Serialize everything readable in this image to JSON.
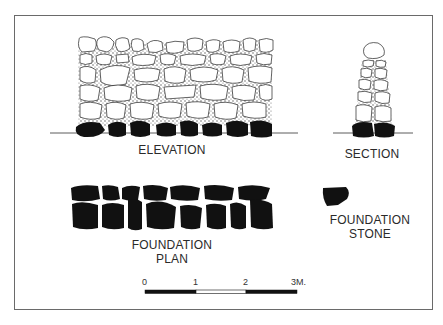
{
  "drawing": {
    "subject": "dry stone wall",
    "views": {
      "elevation": {
        "label": "ELEVATION"
      },
      "section": {
        "label": "SECTION"
      },
      "foundation_plan": {
        "label_line1": "FOUNDATION",
        "label_line2": "PLAN"
      }
    },
    "legend": {
      "symbol": "black-filled-stone",
      "label_line1": "FOUNDATION",
      "label_line2": "STONE"
    },
    "scale_bar": {
      "ticks": [
        "0",
        "1",
        "2",
        "3M."
      ],
      "segments": [
        "black",
        "white",
        "black"
      ],
      "unit": "M."
    },
    "colors": {
      "ink": "#1a1a1a",
      "stone_fill": "#ffffff",
      "foundation_fill": "#111111",
      "frame": "#6a6a6a"
    }
  }
}
